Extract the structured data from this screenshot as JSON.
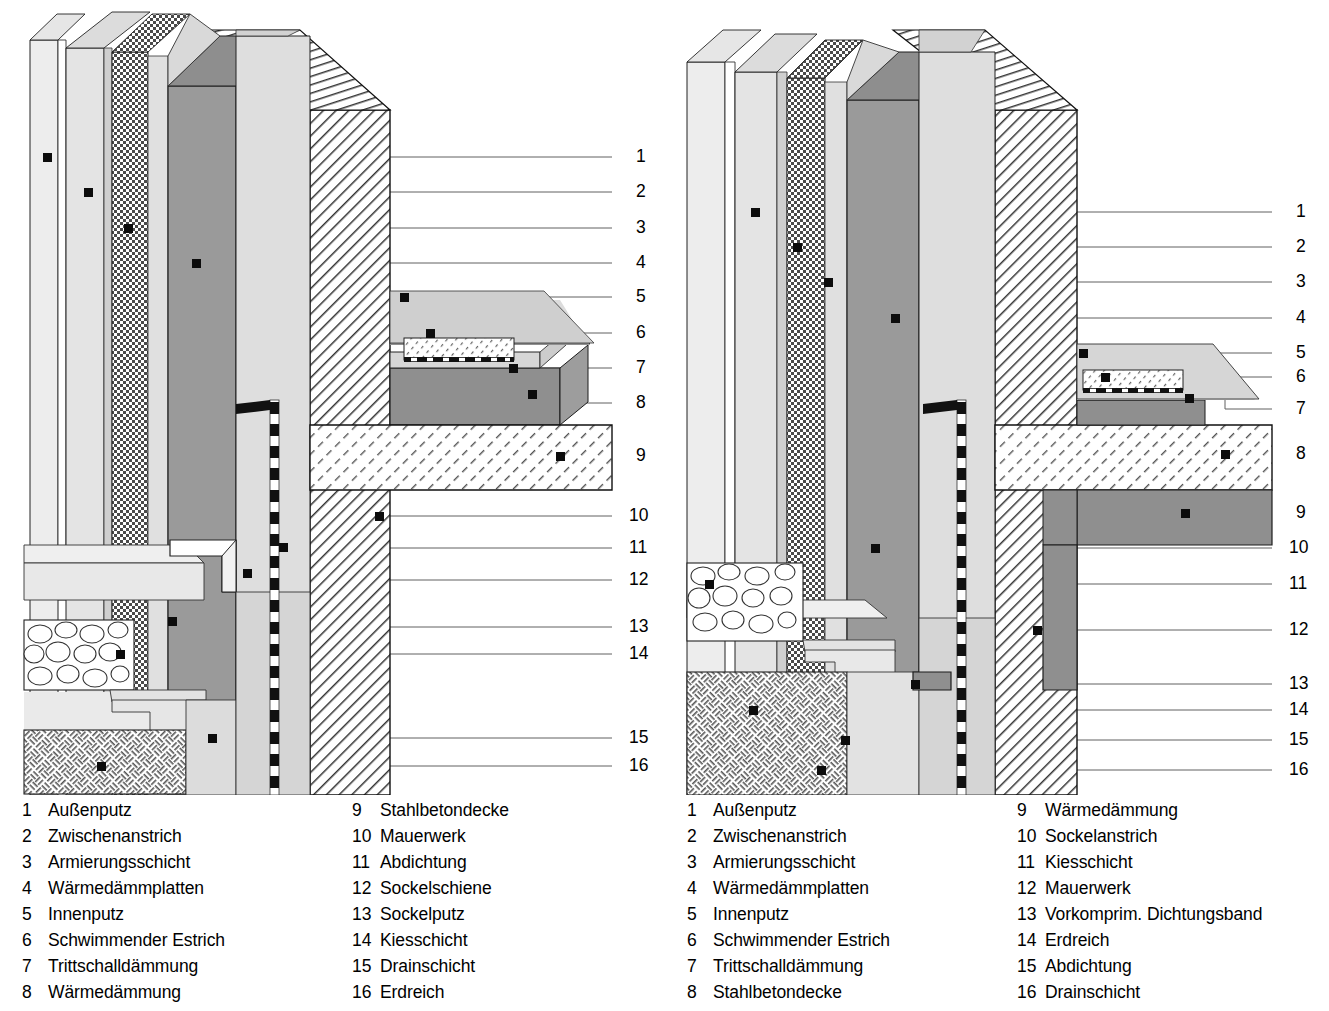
{
  "document": {
    "type": "architectural-detail-drawing",
    "title": "Sockeldetails Wärmedämmverbundsystem",
    "variants": 2
  },
  "left": {
    "id": "detail-left",
    "callout_numbers": [
      "1",
      "2",
      "3",
      "4",
      "5",
      "6",
      "7",
      "8",
      "9",
      "10",
      "11",
      "12",
      "13",
      "14",
      "15",
      "16"
    ],
    "legend": {
      "column1": [
        {
          "num": "1",
          "label": "Außenputz"
        },
        {
          "num": "2",
          "label": "Zwischenanstrich"
        },
        {
          "num": "3",
          "label": "Armierungsschicht"
        },
        {
          "num": "4",
          "label": "Wärmedämmplatten"
        },
        {
          "num": "5",
          "label": "Innenputz"
        },
        {
          "num": "6",
          "label": "Schwimmender Estrich"
        },
        {
          "num": "7",
          "label": "Trittschalldämmung"
        },
        {
          "num": "8",
          "label": "Wärmedämmung"
        }
      ],
      "column2": [
        {
          "num": "9",
          "label": "Stahlbetondecke"
        },
        {
          "num": "10",
          "label": "Mauerwerk"
        },
        {
          "num": "11",
          "label": "Abdichtung"
        },
        {
          "num": "12",
          "label": "Sockelschiene"
        },
        {
          "num": "13",
          "label": "Sockelputz"
        },
        {
          "num": "14",
          "label": "Kiesschicht"
        },
        {
          "num": "15",
          "label": "Drainschicht"
        },
        {
          "num": "16",
          "label": "Erdreich"
        }
      ]
    }
  },
  "right": {
    "id": "detail-right",
    "callout_numbers": [
      "1",
      "2",
      "3",
      "4",
      "5",
      "6",
      "7",
      "8",
      "9",
      "10",
      "11",
      "12",
      "13",
      "14",
      "15",
      "16"
    ],
    "legend": {
      "column1": [
        {
          "num": "1",
          "label": "Außenputz"
        },
        {
          "num": "2",
          "label": "Zwischenanstrich"
        },
        {
          "num": "3",
          "label": "Armierungsschicht"
        },
        {
          "num": "4",
          "label": "Wärmedämmplatten"
        },
        {
          "num": "5",
          "label": "Innenputz"
        },
        {
          "num": "6",
          "label": "Schwimmender Estrich"
        },
        {
          "num": "7",
          "label": "Trittschalldämmung"
        },
        {
          "num": "8",
          "label": "Stahlbetondecke"
        }
      ],
      "column2": [
        {
          "num": "9",
          "label": "Wärmedämmung"
        },
        {
          "num": "10",
          "label": "Sockelanstrich"
        },
        {
          "num": "11",
          "label": "Kiesschicht"
        },
        {
          "num": "12",
          "label": "Mauerwerk"
        },
        {
          "num": "13",
          "label": "Vorkomprim. Dichtungsband"
        },
        {
          "num": "14",
          "label": "Erdreich"
        },
        {
          "num": "15",
          "label": "Abdichtung"
        },
        {
          "num": "16",
          "label": "Drainschicht"
        }
      ]
    }
  },
  "colors": {
    "line": "#1a1a1a",
    "leader": "#555555",
    "render_light": "#e2e2e2",
    "render_mid": "#c9c9c9",
    "render_dark": "#9a9a9a",
    "render_darker": "#8a8a8a",
    "white": "#ffffff",
    "background": "#ffffff"
  },
  "callout_positions": {
    "left_y": [
      157,
      192,
      228,
      263,
      297,
      333,
      368,
      403,
      456,
      516,
      548,
      580,
      627,
      654,
      738,
      766
    ],
    "right_y": [
      212,
      247,
      282,
      318,
      353,
      377,
      409,
      454,
      513,
      548,
      584,
      630,
      684,
      710,
      740,
      770
    ]
  }
}
